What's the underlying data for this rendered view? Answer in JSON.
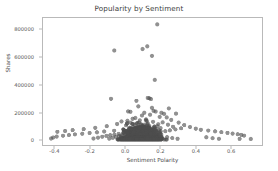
{
  "chart_data": {
    "type": "scatter",
    "title": "Popularity by Sentiment",
    "xlabel": "Sentiment Polarity",
    "ylabel": "Shares",
    "xlim": [
      -0.47,
      0.78
    ],
    "ylim": [
      -40000,
      890000
    ],
    "xticks": [
      -0.4,
      -0.2,
      0.0,
      0.2,
      0.4,
      0.6
    ],
    "xticklabels": [
      "-0.4",
      "-0.2",
      "0.0",
      "0.2",
      "0.4",
      "0.6"
    ],
    "yticks": [
      0,
      200000,
      400000,
      600000,
      800000
    ],
    "yticklabels": [
      "0",
      "200000",
      "400000",
      "600000",
      "800000"
    ],
    "grid": false,
    "legend": null,
    "marker": {
      "shape": "circle",
      "color": "#4d4d4d",
      "size": 2.1,
      "alpha": 0.62
    },
    "series": [
      {
        "name": "articles",
        "points": [
          [
            0.182,
            843000
          ],
          [
            0.125,
            683000
          ],
          [
            0.098,
            663000
          ],
          [
            -0.063,
            652000
          ],
          [
            0.152,
            613000
          ],
          [
            0.168,
            437000
          ],
          [
            -0.082,
            299000
          ],
          [
            0.128,
            305000
          ],
          [
            0.137,
            302000
          ],
          [
            0.146,
            296000
          ],
          [
            0.063,
            284000
          ],
          [
            0.074,
            243000
          ],
          [
            0.152,
            232000
          ],
          [
            0.016,
            206000
          ],
          [
            0.029,
            203000
          ],
          [
            0.248,
            228000
          ],
          [
            0.161,
            210000
          ],
          [
            0.173,
            205000
          ],
          [
            0.108,
            196000
          ],
          [
            0.206,
            196000
          ],
          [
            0.221,
            188000
          ],
          [
            0.289,
            190000
          ],
          [
            0.141,
            182000
          ],
          [
            0.095,
            176000
          ],
          [
            0.196,
            166000
          ],
          [
            0.236,
            162000
          ],
          [
            0.057,
            158000
          ],
          [
            0.041,
            152000
          ],
          [
            0.118,
            148000
          ],
          [
            0.262,
            144000
          ],
          [
            0.082,
            140000
          ],
          [
            0.012,
            138000
          ],
          [
            -0.022,
            132000
          ],
          [
            0.158,
            130000
          ],
          [
            0.213,
            126000
          ],
          [
            0.304,
            124000
          ],
          [
            0.069,
            121000
          ],
          [
            0.128,
            118000
          ],
          [
            -0.047,
            114000
          ],
          [
            0.188,
            112000
          ],
          [
            0.243,
            109000
          ],
          [
            0.336,
            106000
          ],
          [
            0.004,
            104000
          ],
          [
            0.101,
            101000
          ],
          [
            -0.106,
            98000
          ],
          [
            0.166,
            96000
          ],
          [
            0.272,
            94000
          ],
          [
            0.369,
            92000
          ],
          [
            0.046,
            90000
          ],
          [
            0.134,
            88000
          ],
          [
            -0.172,
            86000
          ],
          [
            0.201,
            84000
          ],
          [
            0.318,
            82000
          ],
          [
            0.402,
            80000
          ],
          [
            0.024,
            78000
          ],
          [
            0.112,
            77000
          ],
          [
            -0.238,
            76000
          ],
          [
            0.178,
            75000
          ],
          [
            0.286,
            74000
          ],
          [
            0.431,
            72000
          ],
          [
            -0.009,
            71000
          ],
          [
            0.088,
            70000
          ],
          [
            -0.301,
            69000
          ],
          [
            0.152,
            68000
          ],
          [
            0.254,
            67000
          ],
          [
            0.473,
            66000
          ],
          [
            -0.064,
            65000
          ],
          [
            0.062,
            64000
          ],
          [
            -0.344,
            63000
          ],
          [
            0.126,
            62000
          ],
          [
            0.228,
            61000
          ],
          [
            0.512,
            60000
          ],
          [
            -0.121,
            59000
          ],
          [
            0.036,
            58000
          ],
          [
            -0.388,
            57000
          ],
          [
            0.098,
            56000
          ],
          [
            0.196,
            55000
          ],
          [
            0.548,
            54000
          ],
          [
            -0.162,
            53000
          ],
          [
            0.012,
            52000
          ],
          [
            0.072,
            51000
          ],
          [
            0.164,
            50000
          ],
          [
            0.583,
            49000
          ],
          [
            -0.204,
            48000
          ],
          [
            -0.014,
            47000
          ],
          [
            0.048,
            46000
          ],
          [
            0.136,
            45000
          ],
          [
            0.612,
            44000
          ],
          [
            -0.246,
            43000
          ],
          [
            -0.038,
            42000
          ],
          [
            0.024,
            41000
          ],
          [
            0.108,
            40000
          ],
          [
            0.641,
            39000
          ],
          [
            -0.288,
            38000
          ],
          [
            -0.062,
            37000
          ],
          [
            0.002,
            36000
          ],
          [
            0.082,
            35000
          ],
          [
            0.662,
            34000
          ],
          [
            -0.322,
            33000
          ],
          [
            -0.086,
            32000
          ],
          [
            -0.018,
            31000
          ],
          [
            0.058,
            30000
          ],
          [
            0.678,
            29000
          ],
          [
            -0.356,
            28000
          ],
          [
            -0.108,
            27000
          ],
          [
            -0.036,
            26000
          ],
          [
            0.036,
            25000
          ],
          [
            0.716,
            4000
          ],
          [
            -0.392,
            22000
          ],
          [
            -0.132,
            21000
          ],
          [
            -0.054,
            20000
          ],
          [
            0.016,
            19000
          ],
          [
            0.238,
            18000
          ],
          [
            0.462,
            17000
          ],
          [
            -0.412,
            15000
          ],
          [
            -0.156,
            14000
          ],
          [
            -0.072,
            13000
          ],
          [
            -0.002,
            12000
          ],
          [
            0.268,
            11000
          ],
          [
            0.498,
            10000
          ],
          [
            -0.424,
            8000
          ],
          [
            -0.182,
            7500
          ],
          [
            -0.092,
            7000
          ],
          [
            -0.024,
            6500
          ],
          [
            0.298,
            6000
          ],
          [
            0.534,
            5500
          ],
          [
            0.652,
            5000
          ]
        ]
      }
    ],
    "n_points_approx": 1800
  }
}
